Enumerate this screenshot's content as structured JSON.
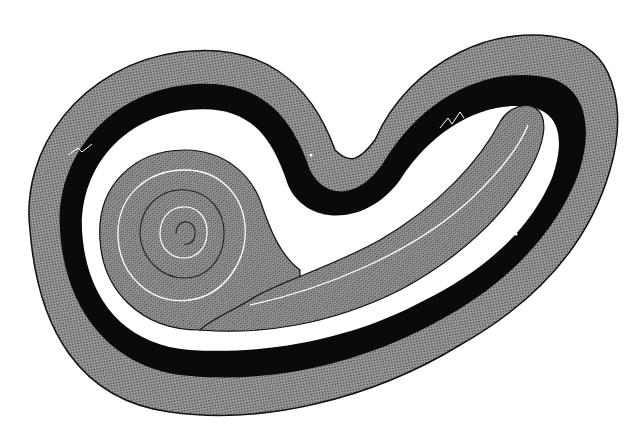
{
  "figure": {
    "colors": {
      "background": "#ffffff",
      "outer_band": "#8a8a8a",
      "black_band": "#0a0a0a",
      "inner_coil": "#8c8c8c",
      "outline": "#111111"
    },
    "parts": [
      {
        "name": "outer-textured-band"
      },
      {
        "name": "black-band"
      },
      {
        "name": "white-gap"
      },
      {
        "name": "inner-spiral-coil"
      },
      {
        "name": "tail-strand"
      }
    ]
  }
}
